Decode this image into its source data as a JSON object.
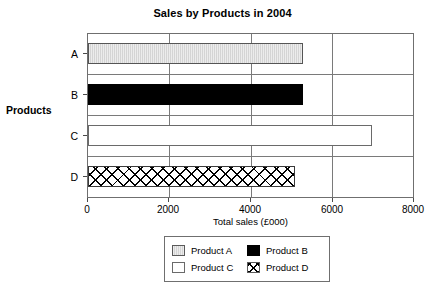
{
  "chart_data": {
    "type": "bar",
    "orientation": "horizontal",
    "title": "Sales by Products in 2004",
    "xlabel": "Total sales (£000)",
    "ylabel": "Products",
    "categories": [
      "A",
      "B",
      "C",
      "D"
    ],
    "values": [
      5300,
      5300,
      7000,
      5100
    ],
    "series": [
      {
        "name": "Product A",
        "category": "A",
        "value": 5300,
        "color": "#d4d4d4",
        "fill": "light-gray"
      },
      {
        "name": "Product B",
        "category": "B",
        "value": 5300,
        "color": "#000000",
        "fill": "solid-black"
      },
      {
        "name": "Product C",
        "category": "C",
        "value": 7000,
        "color": "#ffffff",
        "fill": "white"
      },
      {
        "name": "Product D",
        "category": "D",
        "value": 5100,
        "color": "#ffffff",
        "fill": "crosshatch"
      }
    ],
    "xlim": [
      0,
      8000
    ],
    "xticks": [
      0,
      2000,
      4000,
      6000,
      8000
    ],
    "xtick_labels": [
      "0",
      "2000",
      "4000",
      "6000",
      "8000"
    ],
    "ytick_labels": [
      "A",
      "B",
      "C",
      "D"
    ],
    "grid": true,
    "grid_axis": "both",
    "legend_position": "bottom-center",
    "legend_entries": [
      {
        "label": "Product A",
        "swatch": "light-gray"
      },
      {
        "label": "Product B",
        "swatch": "solid-black"
      },
      {
        "label": "Product C",
        "swatch": "white"
      },
      {
        "label": "Product D",
        "swatch": "crosshatch"
      }
    ]
  }
}
